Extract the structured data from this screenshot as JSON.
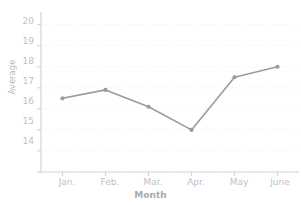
{
  "chart_data": {
    "type": "line",
    "title": "",
    "xlabel": "Month",
    "ylabel": "Average",
    "categories": [
      "Jan.",
      "Feb.",
      "Mar.",
      "Apr.",
      "May",
      "June"
    ],
    "values": [
      16.5,
      16.9,
      16.1,
      15.0,
      17.5,
      18.0
    ],
    "series": [
      {
        "name": "Average",
        "values": [
          16.5,
          16.9,
          16.1,
          15.0,
          17.5,
          18.0
        ],
        "color": "#9a9aa0"
      }
    ],
    "ylim": [
      13,
      20.6
    ],
    "yticks": [
      20,
      19,
      18,
      17,
      16,
      15,
      14
    ],
    "ytick_labels": [
      "20",
      "19",
      "18",
      "17",
      "16",
      "15",
      "14"
    ],
    "grid": true,
    "grid_style": "dotted",
    "grid_color": "#efeff2",
    "legend": "none",
    "marker": "circle",
    "line_color": "#9a9aa0",
    "axis_color": "#d4d4d9",
    "background": "#ffffff"
  }
}
